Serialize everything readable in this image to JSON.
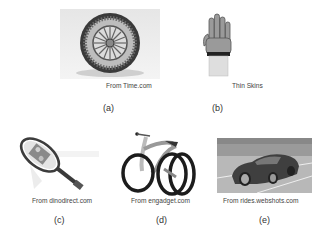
{
  "figure": {
    "panels": [
      {
        "id": "a",
        "image": "tire-icon",
        "caption": "From Time.com",
        "label": "(a)"
      },
      {
        "id": "b",
        "image": "glove-icon",
        "caption": "Thin Skins",
        "label": "(b)"
      },
      {
        "id": "c",
        "image": "tennis-racket-icon",
        "caption": "From dinodirect.com",
        "label": "(c)"
      },
      {
        "id": "d",
        "image": "bicycle-icon",
        "caption": "From engadget.com",
        "label": "(d)"
      },
      {
        "id": "e",
        "image": "sports-car-icon",
        "caption": "From rides.webshots.com",
        "label": "(e)"
      }
    ]
  }
}
